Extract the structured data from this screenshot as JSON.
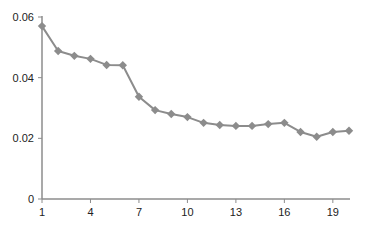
{
  "chart_data": {
    "type": "line",
    "title": "",
    "xlabel": "",
    "ylabel": "",
    "x": [
      1,
      2,
      3,
      4,
      5,
      6,
      7,
      8,
      9,
      10,
      11,
      12,
      13,
      14,
      15,
      16,
      17,
      18,
      19,
      20
    ],
    "series": [
      {
        "name": "series-1",
        "color": "#8c8c8c",
        "marker": "diamond",
        "values": [
          0.057,
          0.0488,
          0.0472,
          0.0462,
          0.0442,
          0.0441,
          0.0337,
          0.0293,
          0.028,
          0.027,
          0.0251,
          0.0244,
          0.0241,
          0.0241,
          0.0247,
          0.0251,
          0.0221,
          0.0205,
          0.0221,
          0.0225
        ]
      }
    ],
    "xticks": [
      1,
      4,
      7,
      10,
      13,
      16,
      19
    ],
    "yticks": [
      0,
      0.02,
      0.04,
      0.06
    ],
    "ytick_labels": [
      "0",
      "0.02",
      "0.04",
      "0.06"
    ],
    "xlim": [
      1,
      20
    ],
    "ylim": [
      0,
      0.06
    ],
    "grid": false,
    "legend": "none"
  }
}
